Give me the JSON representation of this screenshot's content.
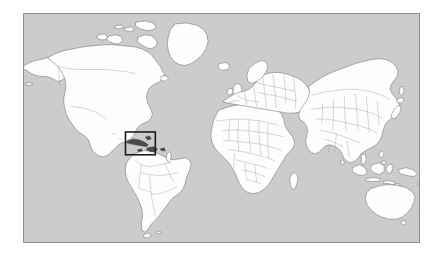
{
  "page": {
    "background_color": "#ffffff",
    "width": 443,
    "height": 261
  },
  "map": {
    "title": "World locator map",
    "projection": "equirectangular",
    "frame": {
      "x": 23,
      "y": 13,
      "width": 397,
      "height": 230,
      "border_color": "#8d8d8d"
    },
    "ocean_color": "#cccccc",
    "land_color": "#fdfdfd",
    "coastline_color": "#6e6e6e",
    "country_border_color": "#9a9a9a",
    "antarctica_shown": false,
    "graticule_shown": false
  },
  "highlight": {
    "label": "Caribbean region inset box",
    "region": "Caribbean",
    "stroke_color": "#1b1b1b",
    "stroke_width": 1.6,
    "fill": "none",
    "box_px": {
      "x": 125,
      "y": 132,
      "width": 30,
      "height": 23
    },
    "highlighted_islands": [
      "Cuba",
      "Hispaniola",
      "Jamaica",
      "Puerto Rico",
      "Bahamas"
    ]
  },
  "landmasses": [
    {
      "name": "North America"
    },
    {
      "name": "Greenland"
    },
    {
      "name": "South America"
    },
    {
      "name": "Europe"
    },
    {
      "name": "Africa"
    },
    {
      "name": "Asia"
    },
    {
      "name": "Australia"
    },
    {
      "name": "New Zealand"
    },
    {
      "name": "Indonesia"
    },
    {
      "name": "Japan"
    },
    {
      "name": "British Isles"
    },
    {
      "name": "Madagascar"
    },
    {
      "name": "Iceland"
    },
    {
      "name": "Sri Lanka"
    },
    {
      "name": "Philippines"
    }
  ]
}
